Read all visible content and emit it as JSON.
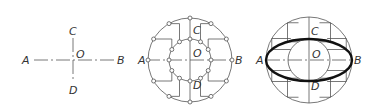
{
  "figures": [
    {
      "id": "step-1",
      "description": "Center lines with axis points",
      "labels": {
        "A": "A",
        "B": "B",
        "C": "C",
        "D": "D",
        "O": "O"
      }
    },
    {
      "id": "step-2",
      "description": "Two concentric circles divided into 12 parts with connecting lines",
      "labels": {
        "A": "A",
        "B": "B",
        "C": "C",
        "D": "D",
        "O": "O"
      },
      "divisions": 12
    },
    {
      "id": "step-3",
      "description": "Ellipse drawn through intersection points",
      "labels": {
        "A": "A",
        "B": "B",
        "C": "C",
        "D": "D",
        "O": "O"
      }
    }
  ],
  "colors": {
    "line": "#555555",
    "ellipse": "#111111",
    "text": "#333333",
    "background": "#ffffff"
  }
}
